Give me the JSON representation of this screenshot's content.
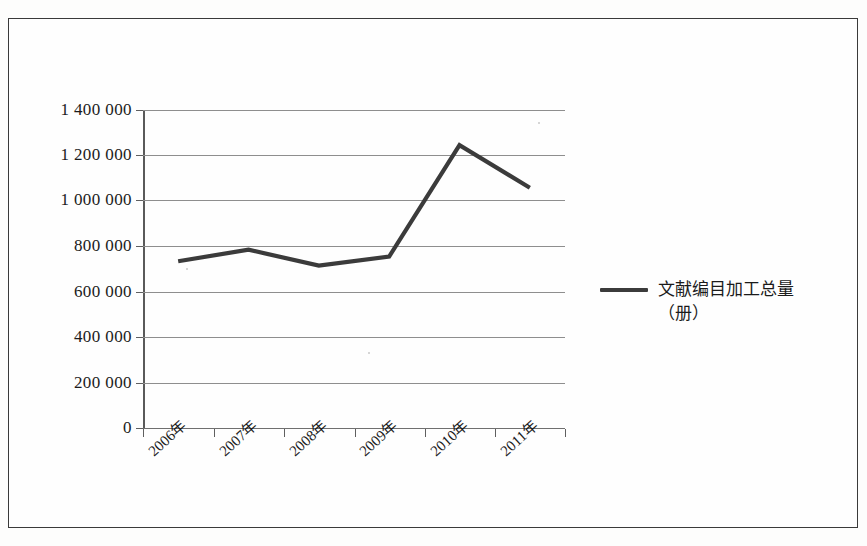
{
  "chart_data": {
    "type": "line",
    "title": "",
    "xlabel": "",
    "ylabel": "",
    "categories": [
      "2006年",
      "2007年",
      "2008年",
      "2009年",
      "2010年",
      "2011年"
    ],
    "series": [
      {
        "name": "文献编目加工总量（册）",
        "values": [
          734000,
          785000,
          715000,
          755000,
          1245000,
          1058000
        ]
      }
    ],
    "ylim": [
      0,
      1400000
    ],
    "ytick_values": [
      0,
      200000,
      400000,
      600000,
      800000,
      1000000,
      1200000,
      1400000
    ],
    "ytick_labels": [
      "1 400 000",
      "1 200 000",
      "1 000 000",
      "800 000",
      "600 000",
      "400 000",
      "200 000",
      "0"
    ],
    "grid": true,
    "legend_position": "right",
    "legend_entries": [
      "文献编目加工总量（册）"
    ],
    "series_color": "#3b3b3b",
    "grid_color": "#8e8e8e",
    "axis_color": "#5a5a5a"
  },
  "legend": {
    "label_line1": "文献编目加工总量",
    "label_line2": "（册）"
  },
  "frame": {
    "border_color": "#3a3a3a",
    "background": "#fefefe"
  }
}
